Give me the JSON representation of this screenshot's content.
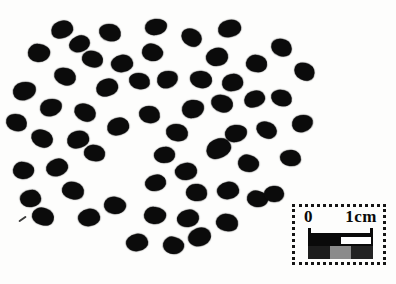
{
  "figure": {
    "background_color": "#fdfdfc",
    "seed_color": "#0b0b0b",
    "seed_count": 60,
    "seeds": [
      [
        62,
        29,
        22,
        17,
        -20
      ],
      [
        110,
        32,
        22,
        17,
        12
      ],
      [
        156,
        27,
        22,
        16,
        -5
      ],
      [
        191,
        37,
        21,
        17,
        25
      ],
      [
        229,
        28,
        23,
        17,
        -12
      ],
      [
        281,
        47,
        21,
        17,
        20
      ],
      [
        39,
        53,
        22,
        18,
        5
      ],
      [
        79,
        44,
        21,
        16,
        -25
      ],
      [
        92,
        59,
        21,
        16,
        15
      ],
      [
        122,
        63,
        22,
        17,
        -10
      ],
      [
        152,
        52,
        21,
        17,
        18
      ],
      [
        217,
        57,
        22,
        18,
        -15
      ],
      [
        256,
        63,
        21,
        17,
        8
      ],
      [
        304,
        71,
        21,
        17,
        25
      ],
      [
        24,
        91,
        23,
        18,
        -10
      ],
      [
        65,
        76,
        22,
        17,
        15
      ],
      [
        107,
        87,
        22,
        17,
        -18
      ],
      [
        139,
        81,
        21,
        16,
        10
      ],
      [
        167,
        79,
        21,
        17,
        -12
      ],
      [
        201,
        79,
        22,
        17,
        6
      ],
      [
        232,
        82,
        21,
        17,
        -8
      ],
      [
        16,
        122,
        21,
        17,
        15
      ],
      [
        51,
        107,
        22,
        17,
        -10
      ],
      [
        85,
        112,
        22,
        17,
        20
      ],
      [
        118,
        126,
        22,
        17,
        -15
      ],
      [
        149,
        114,
        21,
        17,
        8
      ],
      [
        193,
        109,
        22,
        18,
        -6
      ],
      [
        222,
        103,
        22,
        17,
        12
      ],
      [
        254,
        99,
        21,
        16,
        -20
      ],
      [
        281,
        98,
        21,
        16,
        14
      ],
      [
        302,
        123,
        21,
        17,
        -10
      ],
      [
        42,
        138,
        22,
        17,
        18
      ],
      [
        78,
        139,
        22,
        17,
        -14
      ],
      [
        177,
        132,
        22,
        17,
        10
      ],
      [
        236,
        133,
        22,
        17,
        -6
      ],
      [
        266,
        130,
        21,
        16,
        20
      ],
      [
        218,
        148,
        25,
        19,
        -25
      ],
      [
        290,
        158,
        21,
        16,
        4
      ],
      [
        248,
        163,
        21,
        17,
        15
      ],
      [
        164,
        155,
        21,
        16,
        -8
      ],
      [
        94,
        153,
        21,
        16,
        10
      ],
      [
        57,
        167,
        22,
        17,
        -18
      ],
      [
        23,
        170,
        21,
        17,
        6
      ],
      [
        186,
        171,
        22,
        17,
        -10
      ],
      [
        73,
        190,
        22,
        17,
        15
      ],
      [
        30,
        198,
        21,
        17,
        -6
      ],
      [
        115,
        205,
        22,
        17,
        10
      ],
      [
        155,
        183,
        21,
        16,
        -15
      ],
      [
        196,
        192,
        21,
        17,
        5
      ],
      [
        228,
        190,
        22,
        17,
        -10
      ],
      [
        257,
        199,
        21,
        16,
        14
      ],
      [
        274,
        194,
        20,
        16,
        -5
      ],
      [
        43,
        216,
        22,
        17,
        18
      ],
      [
        89,
        217,
        22,
        17,
        -10
      ],
      [
        155,
        215,
        22,
        17,
        6
      ],
      [
        188,
        218,
        22,
        17,
        -15
      ],
      [
        227,
        222,
        22,
        17,
        10
      ],
      [
        137,
        242,
        22,
        17,
        -10
      ],
      [
        173,
        245,
        21,
        17,
        14
      ],
      [
        199,
        237,
        23,
        18,
        -22
      ]
    ],
    "marks": [
      [
        22,
        219,
        9,
        2,
        -35
      ]
    ]
  },
  "scale_bar": {
    "label_zero": "0",
    "label_one_cm": "1cm",
    "border_color": "#151515",
    "upper_segments": [
      "#0a0a0a",
      "#ffffff"
    ],
    "lower_segments": [
      "#1d1d1d",
      "#8b8b8b",
      "#232323"
    ]
  }
}
